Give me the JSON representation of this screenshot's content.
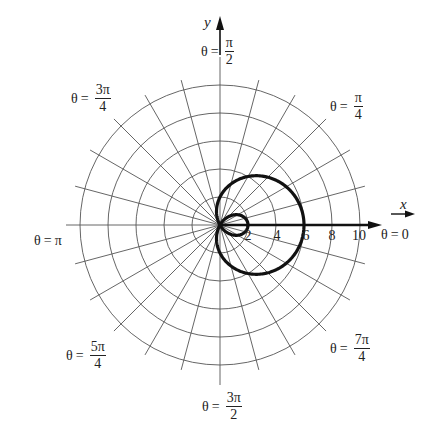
{
  "chart_data": {
    "type": "line",
    "subtype": "polar",
    "title": "",
    "equation": "r = 2 + 4 cos θ",
    "curve": "limaçon with inner loop",
    "series": [
      {
        "name": "r = 2 + 4cos θ",
        "points_polar": [
          {
            "theta": "0",
            "r": 6
          },
          {
            "theta": "π/4",
            "r": 4.83
          },
          {
            "theta": "π/2",
            "r": 2
          },
          {
            "theta": "2π/3",
            "r": 0
          },
          {
            "theta": "3π/4",
            "r": -0.83
          },
          {
            "theta": "π",
            "r": -2
          },
          {
            "theta": "5π/4",
            "r": -0.83
          },
          {
            "theta": "4π/3",
            "r": 0
          },
          {
            "theta": "3π/2",
            "r": 2
          },
          {
            "theta": "7π/4",
            "r": 4.83
          },
          {
            "theta": "2π",
            "r": 6
          }
        ]
      }
    ],
    "radial_ticks": [
      "2",
      "4",
      "6",
      "8",
      "10"
    ],
    "radial_range": [
      0,
      10
    ],
    "grid": {
      "circles": [
        2,
        4,
        6,
        8,
        10
      ],
      "spoke_step": "π/12"
    },
    "angle_labels": [
      {
        "angle": "0",
        "text": "θ = 0"
      },
      {
        "angle": "π/4",
        "text": "θ = π/4"
      },
      {
        "angle": "π/2",
        "text": "θ = π/2"
      },
      {
        "angle": "3π/4",
        "text": "θ = 3π/4"
      },
      {
        "angle": "π",
        "text": "θ = π"
      },
      {
        "angle": "5π/4",
        "text": "θ = 5π/4"
      },
      {
        "angle": "3π/2",
        "text": "θ = 3π/2"
      },
      {
        "angle": "7π/4",
        "text": "θ = 7π/4"
      }
    ],
    "xlabel": "x",
    "ylabel": "y"
  },
  "labels": {
    "theta": "θ",
    "eq": "=",
    "pi": "π",
    "x_axis": "x",
    "y_axis": "y",
    "t0": {
      "value": "0"
    },
    "t_pi": {
      "value": "π"
    },
    "t_pi_2": {
      "num": "π",
      "den": "2"
    },
    "t_pi_4": {
      "num": "π",
      "den": "4"
    },
    "t_3pi_4": {
      "num": "3π",
      "den": "4"
    },
    "t_5pi_4": {
      "num": "5π",
      "den": "4"
    },
    "t_3pi_2": {
      "num": "3π",
      "den": "2"
    },
    "t_7pi_4": {
      "num": "7π",
      "den": "4"
    },
    "ticks": [
      "2",
      "4",
      "6",
      "8",
      "10"
    ]
  },
  "style": {
    "grid_color": "#555555",
    "curve_color": "#111111",
    "axis_color": "#111111"
  }
}
